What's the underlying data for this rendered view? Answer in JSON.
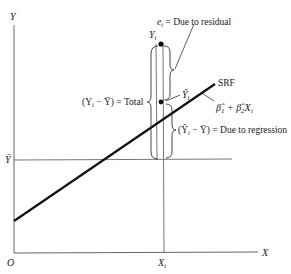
{
  "diagram": {
    "axes": {
      "y_label": "Y",
      "x_label": "X",
      "origin_label": "O",
      "ybar_label": "Ȳ",
      "xi_label": "X",
      "xi_subscript": "i"
    },
    "regression_line": {
      "name": "SRF",
      "equation_b1": "β̂",
      "equation_b1_sub": "1",
      "equation_plus": "+",
      "equation_b2": "β̂",
      "equation_b2_sub": "2",
      "equation_x": "X",
      "equation_x_sub": "i"
    },
    "points": {
      "yi_label": "Y",
      "yi_subscript": "i",
      "yhat_label": "Ŷ",
      "yhat_subscript": "i"
    },
    "annotations": {
      "residual_e": "e",
      "residual_sub": "i",
      "residual_text": " = Due to residual",
      "total_text": "(Y",
      "total_sub": "i",
      "total_rest": " − Ȳ) = Total",
      "regression_text": "(Ŷ",
      "regression_sub": "i",
      "regression_rest": " − Ȳ) = Due to regression"
    },
    "colors": {
      "line": "#111111",
      "axis": "#555555"
    }
  }
}
